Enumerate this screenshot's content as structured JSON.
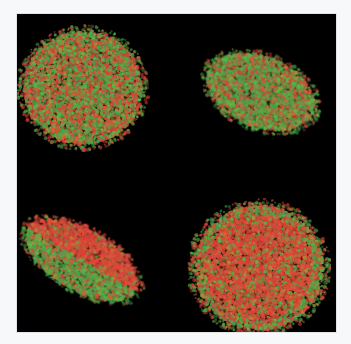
{
  "figure": {
    "background": "#f7f8fa",
    "panel_background": "#000000",
    "colors": {
      "red": "#c8413a",
      "green": "#3fae4a",
      "yellow": "#b59a3c"
    },
    "spheroids": [
      {
        "id": "top-left",
        "cx": 66,
        "cy": 74,
        "rx": 59,
        "ry": 56,
        "rot": 0,
        "red_ratio": 0.45,
        "pattern": "mixed"
      },
      {
        "id": "top-right",
        "cx": 244,
        "cy": 78,
        "rx": 56,
        "ry": 35,
        "rot": 22,
        "red_ratio": 0.35,
        "pattern": "mixed"
      },
      {
        "id": "bottom-left",
        "cx": 65,
        "cy": 246,
        "rx": 62,
        "ry": 30,
        "rot": 30,
        "red_ratio": 0.6,
        "pattern": "red-top-green-bottom"
      },
      {
        "id": "bottom-right",
        "cx": 242,
        "cy": 254,
        "rx": 64,
        "ry": 62,
        "rot": 0,
        "red_ratio": 0.75,
        "pattern": "red-dominant"
      }
    ]
  }
}
